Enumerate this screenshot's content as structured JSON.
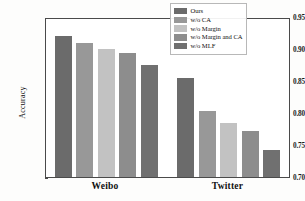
{
  "chart_data": {
    "type": "bar",
    "title": "",
    "xlabel": "",
    "ylabel": "Accuracy",
    "categories": [
      "Weibo",
      "Twitter"
    ],
    "ylim": [
      0.7,
      0.95
    ],
    "yticks": [
      "0.70",
      "0.75",
      "0.80",
      "0.85",
      "0.90",
      "0.95"
    ],
    "ytick_values": [
      0.7,
      0.75,
      0.8,
      0.85,
      0.9,
      0.95
    ],
    "grid": false,
    "legend_position": "upper right",
    "series": [
      {
        "name": "Ours",
        "color": "#6b6b6b",
        "values": [
          0.92,
          0.855
        ]
      },
      {
        "name": "w/o CA",
        "color": "#989898",
        "values": [
          0.91,
          0.803
        ]
      },
      {
        "name": "w/o Margin",
        "color": "#c2c2c2",
        "values": [
          0.9,
          0.785
        ]
      },
      {
        "name": "w/o Margin and CA",
        "color": "#8d8d8d",
        "values": [
          0.894,
          0.772
        ]
      },
      {
        "name": "w/o MLF",
        "color": "#707070",
        "values": [
          0.875,
          0.742
        ]
      }
    ]
  },
  "axes": {
    "ylabel": "Accuracy"
  }
}
